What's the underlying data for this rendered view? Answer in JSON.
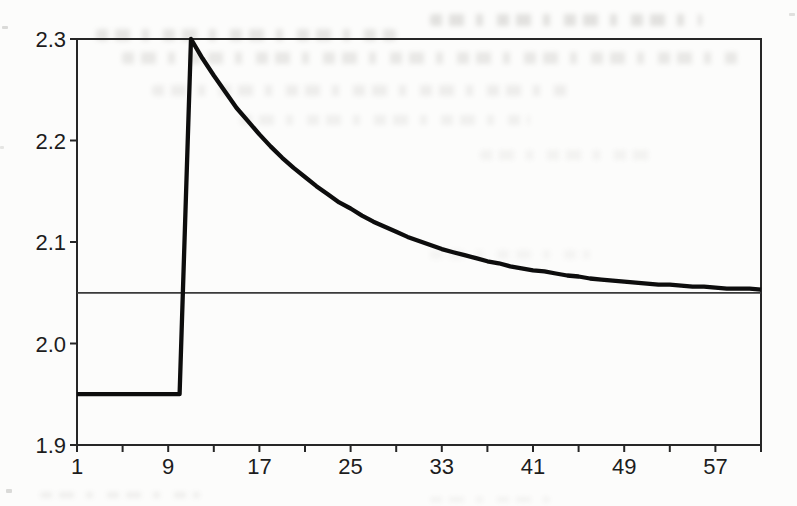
{
  "figure": {
    "background_color": "#fcfcfb",
    "ink_color": "#262626",
    "text_color": "#1d1d1d"
  },
  "chart_data": {
    "type": "line",
    "title": "",
    "subtitle": "",
    "xlabel": "",
    "ylabel": "",
    "xlim": [
      1,
      61
    ],
    "ylim": [
      1.9,
      2.3
    ],
    "grid": false,
    "legend": null,
    "plot_border": true,
    "x_ticks": [
      1,
      5,
      9,
      13,
      17,
      21,
      25,
      29,
      33,
      37,
      41,
      45,
      49,
      53,
      57,
      61
    ],
    "x_tick_labels": [
      "1",
      "",
      "9",
      "",
      "17",
      "",
      "25",
      "",
      "33",
      "",
      "41",
      "",
      "49",
      "",
      "57",
      ""
    ],
    "y_ticks": [
      1.9,
      2.0,
      2.1,
      2.2,
      2.3
    ],
    "y_tick_labels": [
      "1.9",
      "2.0",
      "2.1",
      "2.2",
      "2.3"
    ],
    "series": [
      {
        "name": "steady-state-baseline",
        "color": "#3a3a3a",
        "width": 1.8,
        "x": [
          1,
          61
        ],
        "y": [
          2.05,
          2.05
        ]
      },
      {
        "name": "impulse-response",
        "color": "#0d0d0d",
        "width": 4.3,
        "x": [
          1,
          2,
          3,
          4,
          5,
          6,
          7,
          8,
          9,
          10,
          11,
          12,
          13,
          14,
          15,
          16,
          17,
          18,
          19,
          20,
          21,
          22,
          23,
          24,
          25,
          26,
          27,
          28,
          29,
          30,
          31,
          32,
          33,
          34,
          35,
          36,
          37,
          38,
          39,
          40,
          41,
          42,
          43,
          44,
          45,
          46,
          47,
          48,
          49,
          50,
          51,
          52,
          53,
          54,
          55,
          56,
          57,
          58,
          59,
          60,
          61
        ],
        "y": [
          1.95,
          1.95,
          1.95,
          1.95,
          1.95,
          1.95,
          1.95,
          1.95,
          1.95,
          1.95,
          2.3,
          2.281,
          2.264,
          2.248,
          2.232,
          2.219,
          2.206,
          2.194,
          2.183,
          2.173,
          2.164,
          2.155,
          2.147,
          2.139,
          2.133,
          2.126,
          2.12,
          2.115,
          2.11,
          2.105,
          2.101,
          2.097,
          2.093,
          2.09,
          2.087,
          2.084,
          2.081,
          2.079,
          2.076,
          2.074,
          2.072,
          2.071,
          2.069,
          2.067,
          2.066,
          2.064,
          2.063,
          2.062,
          2.061,
          2.06,
          2.059,
          2.058,
          2.058,
          2.057,
          2.056,
          2.056,
          2.055,
          2.054,
          2.054,
          2.054,
          2.053
        ]
      }
    ]
  }
}
